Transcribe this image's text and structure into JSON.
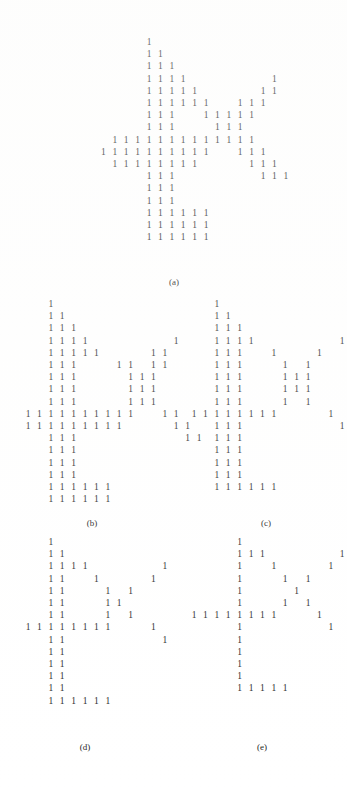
{
  "figure": {
    "glyph": "1",
    "ink_color": "#262626",
    "background_color": "#ffffff",
    "cell_width_px": 11.4,
    "cell_height_px": 12.2,
    "panels": [
      {
        "id": "panel-a",
        "caption": "(a)",
        "caption_x": 174,
        "caption_y": 277,
        "origin_x": 92,
        "origin_y": 38,
        "rows": [
          [
            5
          ],
          [
            5,
            6
          ],
          [
            5,
            6,
            7
          ],
          [
            5,
            6,
            7,
            8,
            16
          ],
          [
            5,
            6,
            7,
            8,
            9,
            15,
            16
          ],
          [
            5,
            6,
            7,
            8,
            9,
            10,
            13,
            14,
            15
          ],
          [
            5,
            6,
            7,
            10,
            11,
            12,
            13,
            14
          ],
          [
            5,
            6,
            7,
            11,
            12,
            13
          ],
          [
            2,
            3,
            4,
            5,
            6,
            7,
            8,
            9,
            10,
            11,
            12,
            13,
            14
          ],
          [
            1,
            2,
            3,
            4,
            5,
            6,
            7,
            8,
            9,
            10,
            13,
            14,
            15
          ],
          [
            2,
            3,
            4,
            5,
            6,
            7,
            8,
            9,
            14,
            15,
            16
          ],
          [
            5,
            6,
            7,
            15,
            16,
            17
          ],
          [
            5,
            6,
            7
          ],
          [
            5,
            6,
            7
          ],
          [
            5,
            6,
            7,
            8,
            9,
            10
          ],
          [
            5,
            6,
            7,
            8,
            9,
            10
          ],
          [
            5,
            6,
            7,
            8,
            9,
            10
          ]
        ]
      },
      {
        "id": "panel-b",
        "caption": "(b)",
        "caption_x": 92,
        "caption_y": 518,
        "origin_x": 28,
        "origin_y": 300,
        "rows": [
          [
            2
          ],
          [
            2,
            3
          ],
          [
            2,
            3,
            4
          ],
          [
            2,
            3,
            4,
            5,
            13
          ],
          [
            2,
            3,
            4,
            5,
            6,
            11,
            12
          ],
          [
            2,
            3,
            4,
            8,
            9,
            11,
            12
          ],
          [
            2,
            3,
            4,
            9,
            10,
            11
          ],
          [
            2,
            3,
            4,
            9,
            10,
            11
          ],
          [
            2,
            3,
            4,
            9,
            10,
            11
          ],
          [
            0,
            1,
            2,
            3,
            4,
            5,
            6,
            7,
            8,
            9,
            12,
            13
          ],
          [
            0,
            1,
            2,
            3,
            4,
            5,
            6,
            7,
            8,
            13,
            14
          ],
          [
            2,
            3,
            4,
            14,
            15
          ],
          [
            2,
            3,
            4
          ],
          [
            2,
            3,
            4
          ],
          [
            2,
            3,
            4
          ],
          [
            2,
            3,
            4,
            5,
            6,
            7
          ],
          [
            2,
            3,
            4,
            5,
            6,
            7
          ]
        ]
      },
      {
        "id": "panel-c",
        "caption": "(c)",
        "caption_x": 266,
        "caption_y": 518,
        "origin_x": 194,
        "origin_y": 300,
        "rows": [
          [
            2
          ],
          [
            2,
            3
          ],
          [
            2,
            3,
            4
          ],
          [
            2,
            3,
            4,
            5,
            13
          ],
          [
            2,
            3,
            4,
            7,
            11
          ],
          [
            2,
            3,
            4,
            8,
            10
          ],
          [
            2,
            3,
            4,
            8,
            9,
            10
          ],
          [
            2,
            3,
            4,
            8,
            9,
            10
          ],
          [
            2,
            3,
            4,
            8,
            10
          ],
          [
            0,
            1,
            2,
            3,
            4,
            5,
            6,
            7,
            12
          ],
          [
            2,
            3,
            4,
            13
          ],
          [
            2,
            3,
            4
          ],
          [
            2,
            3,
            4
          ],
          [
            2,
            3,
            4
          ],
          [
            2,
            3,
            4
          ],
          [
            2,
            3,
            4,
            5,
            6,
            7
          ]
        ]
      },
      {
        "id": "panel-d",
        "caption": "(d)",
        "caption_x": 85,
        "caption_y": 742,
        "origin_x": 28,
        "origin_y": 538,
        "rows": [
          [
            2
          ],
          [
            2,
            3
          ],
          [
            2,
            3,
            4,
            5,
            12
          ],
          [
            2,
            3,
            6,
            11
          ],
          [
            2,
            3,
            7,
            9
          ],
          [
            2,
            3,
            7,
            8
          ],
          [
            2,
            3,
            7,
            9
          ],
          [
            0,
            1,
            2,
            3,
            4,
            5,
            6,
            7,
            11
          ],
          [
            2,
            3,
            12
          ],
          [
            2,
            3
          ],
          [
            2,
            3
          ],
          [
            2,
            3
          ],
          [
            2,
            3
          ],
          [
            2,
            3,
            4,
            5,
            6,
            7
          ]
        ]
      },
      {
        "id": "panel-e",
        "caption": "(e)",
        "caption_x": 262,
        "caption_y": 742,
        "origin_x": 194,
        "origin_y": 538,
        "rows": [
          [
            4
          ],
          [
            4,
            5,
            6,
            13
          ],
          [
            4,
            7,
            12
          ],
          [
            4,
            8,
            10
          ],
          [
            4,
            9
          ],
          [
            4,
            8,
            10
          ],
          [
            0,
            1,
            2,
            3,
            4,
            5,
            6,
            7,
            11
          ],
          [
            4,
            12
          ],
          [
            4
          ],
          [
            4
          ],
          [
            4
          ],
          [
            4
          ],
          [
            4,
            5,
            6,
            7,
            8
          ]
        ]
      }
    ]
  }
}
